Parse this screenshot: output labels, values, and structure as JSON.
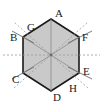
{
  "figure": {
    "name": "labeled-hexagon-diagram",
    "type": "geometry-diagram",
    "width": 103,
    "height": 110,
    "background_color": "#ffffff",
    "shape": {
      "name": "regular-hexagon",
      "fill_color": "#c9c9c9",
      "stroke_color": "#1a1a1a",
      "stroke_width": 1.6,
      "center": {
        "x": 51,
        "y": 55
      },
      "circumradius": 29,
      "vertices": [
        {
          "label": "A",
          "x": 51,
          "y": 19
        },
        {
          "label": "F",
          "x": 79,
          "y": 37
        },
        {
          "label": "E",
          "x": 79,
          "y": 73
        },
        {
          "label": "D",
          "x": 51,
          "y": 91
        },
        {
          "label": "C",
          "x": 23,
          "y": 73
        },
        {
          "label": "B",
          "x": 23,
          "y": 37
        }
      ]
    },
    "diagonals": {
      "name": "center-diagonals",
      "stroke_color": "#8c8c8c",
      "stroke_width": 0.8,
      "lines": [
        {
          "from": "A",
          "to": "D"
        },
        {
          "from": "B",
          "to": "E"
        },
        {
          "from": "C",
          "to": "F"
        }
      ]
    },
    "dashed_axes": {
      "name": "dashed-axis-lines",
      "stroke_color": "#9a9a9a",
      "stroke_width": 0.8,
      "dash_pattern": "2 2",
      "lines": [
        {
          "id": "horizontal-axis",
          "x1": 3,
          "y1": 55,
          "x2": 100,
          "y2": 55
        },
        {
          "id": "diagonal-axis-up-right",
          "x1": 14,
          "y1": 88,
          "x2": 88,
          "y2": 22
        },
        {
          "id": "diagonal-axis-up-left",
          "x1": 88,
          "y1": 88,
          "x2": 14,
          "y2": 22
        }
      ]
    },
    "edge_ticks": {
      "name": "edge-tick-marks",
      "stroke_color": "#6b6b6b",
      "stroke_width": 0.9,
      "marks": [
        {
          "id": "tick-upper-left",
          "x1": 12,
          "y1": 31,
          "x2": 34,
          "y2": 43
        },
        {
          "id": "tick-upper-right",
          "x1": 68,
          "y1": 43,
          "x2": 92,
          "y2": 31
        },
        {
          "id": "tick-lower-left",
          "x1": 12,
          "y1": 79,
          "x2": 34,
          "y2": 67
        },
        {
          "id": "tick-lower-right",
          "x1": 68,
          "y1": 67,
          "x2": 92,
          "y2": 79
        }
      ]
    },
    "center_point": {
      "name": "center-point",
      "x": 51,
      "y": 55,
      "radius": 1.4,
      "color": "#6b6b6b"
    },
    "labels": [
      {
        "key": "A",
        "text": "A",
        "x": 55,
        "y": 8,
        "role": "vertex-label-top"
      },
      {
        "key": "G",
        "text": "G",
        "x": 27,
        "y": 22,
        "role": "point-label-upper-left-edge"
      },
      {
        "key": "B",
        "text": "B",
        "x": 10,
        "y": 32,
        "role": "vertex-label-upper-left"
      },
      {
        "key": "F",
        "text": "F",
        "x": 82,
        "y": 32,
        "role": "vertex-label-upper-right"
      },
      {
        "key": "C",
        "text": "C",
        "x": 12,
        "y": 74,
        "role": "vertex-label-lower-left"
      },
      {
        "key": "E",
        "text": "E",
        "x": 83,
        "y": 66,
        "role": "vertex-label-lower-right"
      },
      {
        "key": "H",
        "text": "H",
        "x": 69,
        "y": 83,
        "role": "point-label-lower-right-edge"
      },
      {
        "key": "D",
        "text": "D",
        "x": 53,
        "y": 92,
        "role": "vertex-label-bottom"
      }
    ]
  }
}
